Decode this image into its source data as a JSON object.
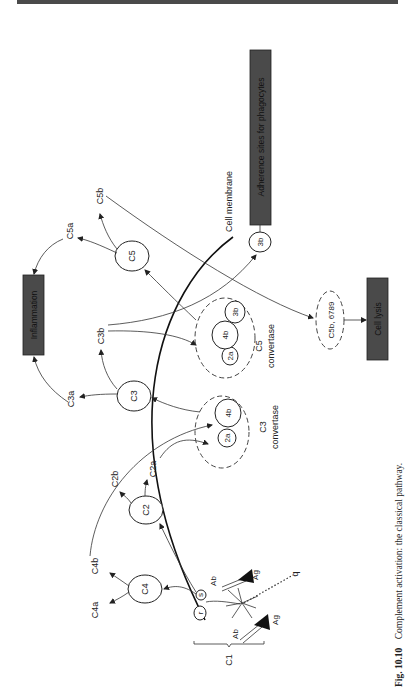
{
  "figure": {
    "orientation": "rotated-90-ccw",
    "caption": {
      "label": "Fig. 10.10",
      "text": "Complement activation: the classical pathway."
    },
    "colors": {
      "box_fill": "#4a4a4a",
      "line": "#333333",
      "background": "#ffffff"
    }
  },
  "boxes": {
    "inflammation": "Inflammation",
    "adherence": "Adherence sites for phagocytes",
    "cell_lysis": "Cell lysis"
  },
  "membrane": {
    "label": "Cell membrane"
  },
  "nodes": {
    "c1": "C1",
    "c1_r": "r",
    "c1_s": "s",
    "c4": "C4",
    "c2": "C2",
    "c3": "C3",
    "c5": "C5",
    "c3b_bound": "3b",
    "c5b6789": "C5b, 6789"
  },
  "fragments": {
    "c4a": "C4a",
    "c4b": "C4b",
    "c2a": "C2a",
    "c2b": "C2b",
    "c3a": "C3a",
    "c3b": "C3b",
    "c5a": "C5a",
    "c5b": "C5b"
  },
  "convertases": {
    "c3": {
      "name": "C3",
      "label": "convertase",
      "parts": [
        "2a",
        "4b"
      ]
    },
    "c5": {
      "name": "C5",
      "label": "convertase",
      "parts": [
        "2a",
        "4b",
        "3b"
      ]
    }
  },
  "antibody_antigen": {
    "ab": "Ab",
    "ag": "Ag",
    "q": "q"
  }
}
